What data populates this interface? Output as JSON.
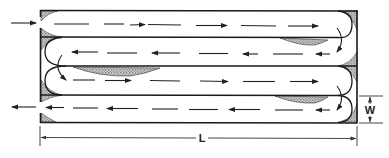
{
  "diagram": {
    "channels": 4,
    "flow_sequence": [
      "right",
      "left",
      "right",
      "left"
    ],
    "inlet": {
      "position": "top-left",
      "direction": "right"
    },
    "outlet": {
      "position": "bottom-left",
      "direction": "left"
    },
    "dead_zones": "shaded corners and wedges behind baffle ends",
    "labels": {
      "length": "L",
      "width": "W"
    },
    "colors": {
      "line": "#1a1a1a",
      "dead_zone_fill": "#9a9a9a",
      "background": "#ffffff"
    }
  }
}
